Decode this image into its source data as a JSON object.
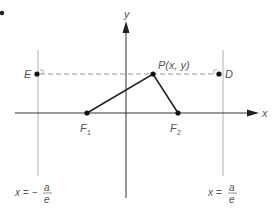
{
  "figure": {
    "type": "ellipse-directrix-diagram",
    "corner_marker": "•",
    "axes": {
      "x_label": "x",
      "y_label": "y"
    },
    "points": {
      "P": {
        "label": "P(x, y)"
      },
      "E": {
        "label": "E"
      },
      "D": {
        "label": "D"
      },
      "F1": {
        "label": "F",
        "subscript": "1"
      },
      "F2": {
        "label": "F",
        "subscript": "2"
      }
    },
    "directrices": {
      "left": {
        "lhs": "x = −",
        "numerator": "a",
        "denominator": "e"
      },
      "right": {
        "lhs": "x = ",
        "numerator": "a",
        "denominator": "e"
      }
    },
    "colors": {
      "axis": "#333333",
      "directrix": "#aaaaaa",
      "dashed": "#999999",
      "segment": "#222222",
      "point": "#111111",
      "label": "#555555"
    }
  }
}
